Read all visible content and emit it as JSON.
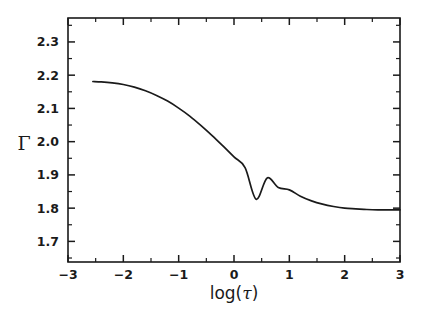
{
  "chart_data": {
    "type": "line",
    "title": "",
    "xlabel": "log(τ)",
    "ylabel": "Γ",
    "xlim": [
      -3,
      3
    ],
    "ylim": [
      1.638,
      2.372
    ],
    "grid": false,
    "legend": null,
    "x_ticks": [
      -3,
      -2,
      -1,
      0,
      1,
      2,
      3
    ],
    "x_tick_labels": [
      "−3",
      "−2",
      "−1",
      "0",
      "1",
      "2",
      "3"
    ],
    "x_minor_ticks": [
      -2.5,
      -1.5,
      -0.5,
      0.5,
      1.5,
      2.5
    ],
    "y_ticks": [
      1.7,
      1.8,
      1.9,
      2.0,
      2.1,
      2.2,
      2.3
    ],
    "y_tick_labels": [
      "1.7",
      "1.8",
      "1.9",
      "2.0",
      "2.1",
      "2.2",
      "2.3"
    ],
    "y_minor_ticks": [
      1.65,
      1.75,
      1.85,
      1.95,
      2.05,
      2.15,
      2.25,
      2.35
    ],
    "series": [
      {
        "name": "Gamma vs log tau",
        "x": [
          -2.55,
          -2.4,
          -2.2,
          -2.0,
          -1.8,
          -1.6,
          -1.4,
          -1.2,
          -1.0,
          -0.8,
          -0.6,
          -0.4,
          -0.2,
          0.0,
          0.2,
          0.4,
          0.6,
          0.8,
          1.0,
          1.2,
          1.4,
          1.6,
          1.8,
          2.0,
          2.2,
          2.4,
          2.6,
          2.8,
          3.0
        ],
        "y": [
          2.181,
          2.18,
          2.177,
          2.172,
          2.164,
          2.153,
          2.139,
          2.122,
          2.101,
          2.077,
          2.049,
          2.019,
          1.987,
          1.954,
          1.922,
          1.827,
          1.891,
          1.862,
          1.855,
          1.836,
          1.822,
          1.812,
          1.805,
          1.8,
          1.798,
          1.796,
          1.795,
          1.795,
          1.795
        ]
      }
    ]
  },
  "axis_labels": {
    "x_title": "log(τ)",
    "y_title": "Γ",
    "x_title_prefix": "log(",
    "x_title_symbol": "τ",
    "x_title_suffix": ")"
  },
  "colors": {
    "curve": "#1a1a1a",
    "frame": "#1a1a1a",
    "background": "#ffffff",
    "text": "#1a1a1a"
  }
}
